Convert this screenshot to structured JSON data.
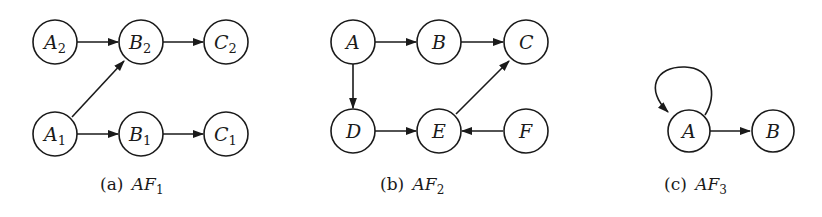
{
  "figures": [
    {
      "id": "a",
      "caption_prefix": "(a)",
      "caption_name": "AF",
      "caption_sub": "1",
      "nodes": [
        {
          "id": "A2",
          "label": "A",
          "sub": "2"
        },
        {
          "id": "B2",
          "label": "B",
          "sub": "2"
        },
        {
          "id": "C2",
          "label": "C",
          "sub": "2"
        },
        {
          "id": "A1",
          "label": "A",
          "sub": "1"
        },
        {
          "id": "B1",
          "label": "B",
          "sub": "1"
        },
        {
          "id": "C1",
          "label": "C",
          "sub": "1"
        }
      ],
      "edges": [
        [
          "A2",
          "B2"
        ],
        [
          "B2",
          "C2"
        ],
        [
          "A1",
          "B2"
        ],
        [
          "A1",
          "B1"
        ],
        [
          "B1",
          "C1"
        ]
      ]
    },
    {
      "id": "b",
      "caption_prefix": "(b)",
      "caption_name": "AF",
      "caption_sub": "2",
      "nodes": [
        {
          "id": "A",
          "label": "A"
        },
        {
          "id": "B",
          "label": "B"
        },
        {
          "id": "C",
          "label": "C"
        },
        {
          "id": "D",
          "label": "D"
        },
        {
          "id": "E",
          "label": "E"
        },
        {
          "id": "F",
          "label": "F"
        }
      ],
      "edges": [
        [
          "A",
          "B"
        ],
        [
          "B",
          "C"
        ],
        [
          "A",
          "D"
        ],
        [
          "D",
          "E"
        ],
        [
          "E",
          "C"
        ],
        [
          "F",
          "E"
        ]
      ]
    },
    {
      "id": "c",
      "caption_prefix": "(c)",
      "caption_name": "AF",
      "caption_sub": "3",
      "nodes": [
        {
          "id": "A",
          "label": "A"
        },
        {
          "id": "B",
          "label": "B"
        }
      ],
      "edges": [
        [
          "A",
          "A"
        ],
        [
          "A",
          "B"
        ]
      ]
    }
  ],
  "colors": {
    "stroke": "#1a1a1a",
    "background": "#ffffff"
  }
}
